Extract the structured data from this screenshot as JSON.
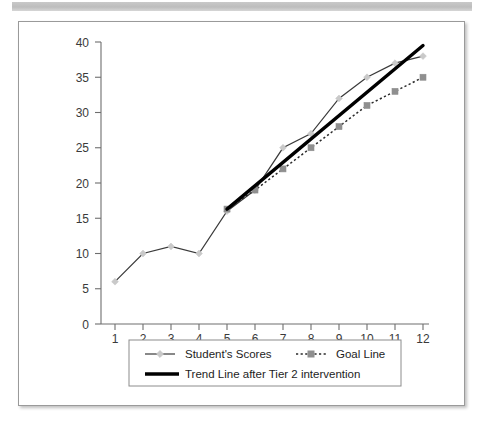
{
  "banner": {
    "name": "top-banner",
    "color": "#c4c4c4"
  },
  "figure": {
    "border_color": "#9a9a9a",
    "background": "#ffffff"
  },
  "chart_data": {
    "type": "line",
    "title": "",
    "xlabel": "",
    "ylabel": "",
    "x": [
      1,
      2,
      3,
      4,
      5,
      6,
      7,
      8,
      9,
      10,
      11,
      12
    ],
    "xticks": [
      "1",
      "2",
      "3",
      "4",
      "5",
      "6",
      "7",
      "8",
      "9",
      "10",
      "11",
      "12"
    ],
    "yticks": [
      "0",
      "5",
      "10",
      "15",
      "20",
      "25",
      "30",
      "35",
      "40"
    ],
    "ylim": [
      0,
      40
    ],
    "xlim": [
      1,
      12
    ],
    "grid": false,
    "legend_position": "bottom",
    "series": [
      {
        "name": "Student's Scores",
        "style": "solid-with-markers",
        "marker": "diamond",
        "color": "#3a3a3a",
        "marker_color": "#c9c9c9",
        "x": [
          1,
          2,
          3,
          4,
          5,
          6,
          7,
          8,
          9,
          10,
          11,
          12
        ],
        "values": [
          6,
          10,
          11,
          10,
          16,
          19,
          25,
          27,
          32,
          35,
          37,
          38
        ]
      },
      {
        "name": "Goal Line",
        "style": "dotted-with-markers",
        "marker": "square",
        "color": "#2a2a2a",
        "marker_color": "#8f8f8f",
        "x": [
          5,
          6,
          7,
          8,
          9,
          10,
          11,
          12
        ],
        "values": [
          16.3,
          19,
          22,
          25,
          28,
          31,
          33,
          35
        ]
      },
      {
        "name": "Trend Line after Tier 2 intervention",
        "style": "thick-solid",
        "marker": "none",
        "color": "#000000",
        "x": [
          5,
          12
        ],
        "values": [
          16.3,
          39.5
        ]
      }
    ],
    "legend": [
      {
        "label": "Student's Scores",
        "swatch": "solid-diamond"
      },
      {
        "label": "Goal Line",
        "swatch": "dotted-square"
      },
      {
        "label": "Trend Line after Tier 2 intervention",
        "swatch": "thick-solid"
      }
    ]
  }
}
